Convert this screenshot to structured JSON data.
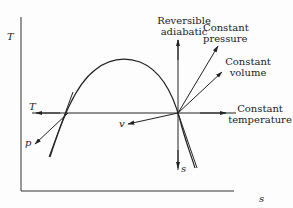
{
  "diagram": {
    "type": "T-s diagram (temperature-entropy)",
    "axes": {
      "y_label": "T",
      "x_label": "s"
    },
    "curves": {
      "saturation_dome": "bell-shaped curve",
      "state_point_lines": [
        {
          "id": "reversible-adiabatic",
          "label_line1": "Reversible",
          "label_line2": "adiabatic",
          "direction": "vertical"
        },
        {
          "id": "constant-pressure",
          "label_line1": "Constant",
          "label_line2": "pressure"
        },
        {
          "id": "constant-volume",
          "label_line1": "Constant",
          "label_line2": "volume"
        },
        {
          "id": "constant-temperature",
          "label_line1": "Constant",
          "label_line2": "temperature",
          "direction": "horizontal"
        }
      ],
      "arrow_labels": {
        "T_left": "T",
        "p_left": "p",
        "v_left": "v",
        "s_down": "s"
      }
    }
  }
}
